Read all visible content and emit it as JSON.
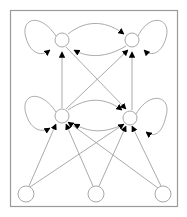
{
  "diagram": {
    "type": "directed-graph",
    "colors": {
      "background": "#ffffff",
      "frame": "#9a9a9a",
      "node": "#a8a8a8",
      "edge": "#a0a0a0",
      "arrowhead": "#000000"
    },
    "nodes": [
      {
        "id": "top-left",
        "x": 62,
        "y": 40
      },
      {
        "id": "top-right",
        "x": 132,
        "y": 40
      },
      {
        "id": "mid-left",
        "x": 62,
        "y": 116
      },
      {
        "id": "mid-right",
        "x": 130,
        "y": 118
      },
      {
        "id": "bottom-left",
        "x": 26,
        "y": 194
      },
      {
        "id": "bottom-middle",
        "x": 96,
        "y": 194
      },
      {
        "id": "bottom-right",
        "x": 163,
        "y": 194
      }
    ],
    "edges": [
      {
        "from": "top-left",
        "to": "top-left",
        "kind": "self-loop"
      },
      {
        "from": "top-right",
        "to": "top-right",
        "kind": "self-loop"
      },
      {
        "from": "mid-left",
        "to": "mid-left",
        "kind": "self-loop"
      },
      {
        "from": "mid-right",
        "to": "mid-right",
        "kind": "self-loop"
      },
      {
        "from": "top-left",
        "to": "top-right"
      },
      {
        "from": "top-right",
        "to": "top-left"
      },
      {
        "from": "mid-left",
        "to": "mid-right"
      },
      {
        "from": "mid-right",
        "to": "mid-left"
      },
      {
        "from": "mid-left",
        "to": "top-left"
      },
      {
        "from": "mid-left",
        "to": "top-right"
      },
      {
        "from": "mid-right",
        "to": "top-right"
      },
      {
        "from": "top-left",
        "to": "mid-right"
      },
      {
        "from": "bottom-left",
        "to": "mid-right"
      },
      {
        "from": "bottom-middle",
        "to": "mid-left"
      },
      {
        "from": "bottom-middle",
        "to": "mid-right"
      },
      {
        "from": "bottom-right",
        "to": "mid-left"
      },
      {
        "from": "bottom-right",
        "to": "mid-right"
      },
      {
        "from": "bottom-left",
        "to": "top-right"
      }
    ]
  }
}
